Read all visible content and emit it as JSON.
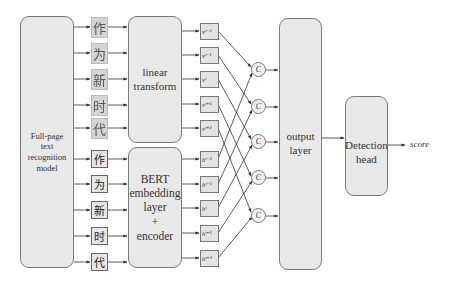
{
  "diagram": {
    "nodes": {
      "ocr_model": "Full-page text recognition model",
      "ocr_model_lines": [
        "Full-page",
        "text",
        "recognition",
        "model"
      ],
      "linear_transform_lines": [
        "linear",
        "transform"
      ],
      "bert_lines": [
        "BERT",
        "embedding",
        "layer",
        "+",
        "encoder"
      ],
      "output_layer_lines": [
        "output",
        "layer"
      ],
      "detection_head_lines": [
        "Detection",
        "head"
      ],
      "score": "score"
    },
    "char_images": [
      "作",
      "为",
      "新",
      "时",
      "代"
    ],
    "chars": [
      "作",
      "为",
      "新",
      "时",
      "代"
    ],
    "v_vectors": [
      "v^{t-2}",
      "v^{t-1}",
      "v^{t}",
      "v^{t+1}",
      "v^{t+2}"
    ],
    "v_labels": [
      "vᵗ⁻²",
      "vᵗ⁻¹",
      "vᵗ",
      "vᵗ⁺¹",
      "vᵗ⁺²"
    ],
    "h_labels": [
      "hᵗ⁻²",
      "hᵗ⁻¹",
      "hᵗ",
      "hᵗ⁺¹",
      "hᵗ⁺²"
    ],
    "concat_nodes": [
      "C",
      "C",
      "C",
      "C",
      "C"
    ],
    "edges": [
      "Full-page text recognition model -> character images",
      "Full-page text recognition model -> characters",
      "character images -> linear transform",
      "characters -> BERT embedding layer + encoder",
      "linear transform -> v vectors",
      "BERT embedding layer + encoder -> h vectors",
      "v/h vectors -> C (concatenation)",
      "C -> output layer",
      "output layer -> Detection head",
      "Detection head -> score"
    ]
  }
}
